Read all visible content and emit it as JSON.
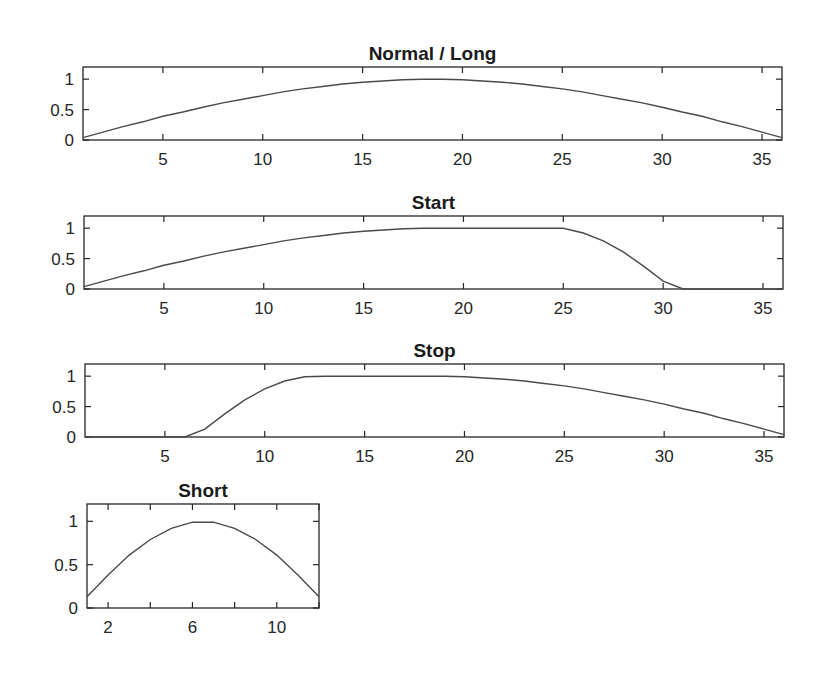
{
  "chart_data": [
    {
      "type": "line",
      "title": "Normal / Long",
      "xlabel": "",
      "ylabel": "",
      "xlim": [
        1,
        36
      ],
      "ylim": [
        0,
        1.2
      ],
      "xticks": [
        5,
        10,
        15,
        20,
        25,
        30,
        35
      ],
      "yticks": [
        0,
        0.5,
        1
      ],
      "ytick_labels": [
        "0",
        "0.5",
        "1"
      ],
      "grid": false,
      "x": [
        1,
        2,
        3,
        4,
        5,
        6,
        7,
        8,
        9,
        10,
        11,
        12,
        13,
        14,
        15,
        16,
        17,
        18,
        19,
        20,
        21,
        22,
        23,
        24,
        25,
        26,
        27,
        28,
        29,
        30,
        31,
        32,
        33,
        34,
        35,
        36
      ],
      "values": [
        0.04,
        0.13,
        0.22,
        0.3,
        0.39,
        0.46,
        0.54,
        0.61,
        0.67,
        0.73,
        0.79,
        0.84,
        0.88,
        0.92,
        0.95,
        0.97,
        0.99,
        1.0,
        1.0,
        0.99,
        0.97,
        0.95,
        0.92,
        0.88,
        0.84,
        0.79,
        0.73,
        0.67,
        0.61,
        0.54,
        0.46,
        0.39,
        0.3,
        0.22,
        0.13,
        0.04
      ]
    },
    {
      "type": "line",
      "title": "Start",
      "xlabel": "",
      "ylabel": "",
      "xlim": [
        1,
        36
      ],
      "ylim": [
        0,
        1.2
      ],
      "xticks": [
        5,
        10,
        15,
        20,
        25,
        30,
        35
      ],
      "yticks": [
        0,
        0.5,
        1
      ],
      "ytick_labels": [
        "0",
        "0.5",
        "1"
      ],
      "grid": false,
      "x": [
        1,
        2,
        3,
        4,
        5,
        6,
        7,
        8,
        9,
        10,
        11,
        12,
        13,
        14,
        15,
        16,
        17,
        18,
        19,
        20,
        21,
        22,
        23,
        24,
        25,
        26,
        27,
        28,
        29,
        30,
        31,
        32,
        33,
        34,
        35,
        36
      ],
      "values": [
        0.04,
        0.13,
        0.22,
        0.3,
        0.39,
        0.46,
        0.54,
        0.61,
        0.67,
        0.73,
        0.79,
        0.84,
        0.88,
        0.92,
        0.95,
        0.97,
        0.99,
        1.0,
        1.0,
        1.0,
        1.0,
        1.0,
        1.0,
        1.0,
        1.0,
        0.92,
        0.79,
        0.61,
        0.38,
        0.13,
        0,
        0,
        0,
        0,
        0,
        0
      ]
    },
    {
      "type": "line",
      "title": "Stop",
      "xlabel": "",
      "ylabel": "",
      "xlim": [
        1,
        36
      ],
      "ylim": [
        0,
        1.2
      ],
      "xticks": [
        5,
        10,
        15,
        20,
        25,
        30,
        35
      ],
      "yticks": [
        0,
        0.5,
        1
      ],
      "ytick_labels": [
        "0",
        "0.5",
        "1"
      ],
      "grid": false,
      "x": [
        1,
        2,
        3,
        4,
        5,
        6,
        7,
        8,
        9,
        10,
        11,
        12,
        13,
        14,
        15,
        16,
        17,
        18,
        19,
        20,
        21,
        22,
        23,
        24,
        25,
        26,
        27,
        28,
        29,
        30,
        31,
        32,
        33,
        34,
        35,
        36
      ],
      "values": [
        0,
        0,
        0,
        0,
        0,
        0,
        0.13,
        0.38,
        0.61,
        0.79,
        0.92,
        0.99,
        1.0,
        1.0,
        1.0,
        1.0,
        1.0,
        1.0,
        1.0,
        0.99,
        0.97,
        0.95,
        0.92,
        0.88,
        0.84,
        0.79,
        0.73,
        0.67,
        0.61,
        0.54,
        0.46,
        0.39,
        0.3,
        0.22,
        0.13,
        0.04
      ]
    },
    {
      "type": "line",
      "title": "Short",
      "xlabel": "",
      "ylabel": "",
      "xlim": [
        1,
        12
      ],
      "ylim": [
        0,
        1.2
      ],
      "xticks": [
        2,
        4,
        6,
        8,
        10,
        12
      ],
      "xtick_labels": [
        "2",
        "",
        "6",
        "",
        "10",
        ""
      ],
      "yticks": [
        0,
        0.5,
        1
      ],
      "ytick_labels": [
        "0",
        "0.5",
        "1"
      ],
      "grid": false,
      "x": [
        1,
        2,
        3,
        4,
        5,
        6,
        7,
        8,
        9,
        10,
        11,
        12
      ],
      "values": [
        0.13,
        0.38,
        0.61,
        0.79,
        0.92,
        0.99,
        0.99,
        0.92,
        0.79,
        0.61,
        0.38,
        0.13
      ]
    }
  ],
  "layout": {
    "panels": [
      {
        "left": 83,
        "right": 782,
        "top": 67,
        "bottom": 140
      },
      {
        "left": 84,
        "right": 783,
        "top": 216,
        "bottom": 289
      },
      {
        "left": 85,
        "right": 784,
        "top": 364,
        "bottom": 437
      },
      {
        "left": 87,
        "right": 319,
        "top": 504,
        "bottom": 608
      }
    ]
  }
}
